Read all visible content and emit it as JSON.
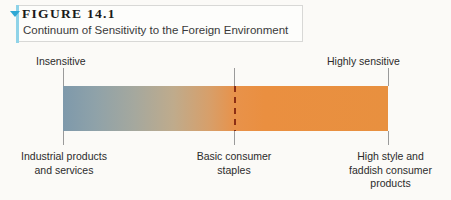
{
  "figure": {
    "number": "FIGURE 14.1",
    "title": "Continuum of Sensitivity to the Foreign Environment",
    "marker_icon": "triangle-down-icon",
    "accent_color": "#2fa8d4",
    "rule_color": "#8fd3e8"
  },
  "scale": {
    "left_label": "Insensitive",
    "right_label": "Highly sensitive",
    "gradient_start_color": "#7e99ab",
    "gradient_end_color": "#e8903f",
    "divider_color": "#8c2f14",
    "tick_color": "#9a9a9a"
  },
  "endpoints": {
    "left": "Industrial products\nand services",
    "middle": "Basic consumer\nstaples",
    "right": "High style and\nfaddish consumer\nproducts"
  },
  "chart_data": {
    "type": "bar",
    "title": "Continuum of Sensitivity to the Foreign Environment",
    "xlabel": "",
    "ylabel": "",
    "axis_endpoints": [
      "Insensitive",
      "Highly sensitive"
    ],
    "categories": [
      "Industrial products and services",
      "Basic consumer staples",
      "High style and faddish consumer products"
    ],
    "x": [
      0,
      52.6,
      100
    ],
    "values": [
      0,
      52.6,
      100
    ],
    "xlim": [
      0,
      100
    ],
    "grid": false,
    "legend": "none",
    "annotations": [
      "Dashed vertical divider at the 'Basic consumer staples' midpoint",
      "Horizontal color gradient from blue-gray (insensitive) to orange (highly sensitive)"
    ]
  }
}
